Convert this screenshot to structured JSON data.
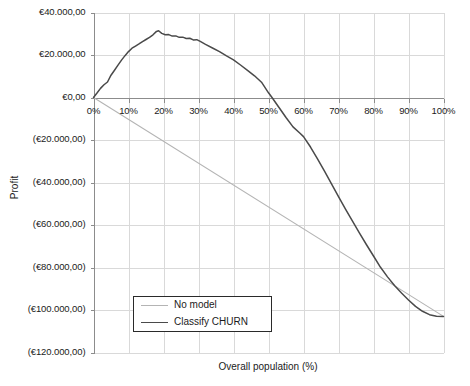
{
  "chart_data": {
    "type": "line",
    "title": "",
    "xlabel": "Overall population (%)",
    "ylabel": "Profit",
    "xlim": [
      0,
      100
    ],
    "ylim": [
      -120000,
      40000
    ],
    "grid": true,
    "legend_position": "bottom-left",
    "x_tick_labels": [
      "0%",
      "10%",
      "20%",
      "30%",
      "40%",
      "50%",
      "60%",
      "70%",
      "80%",
      "90%",
      "100%"
    ],
    "x_tick_values": [
      0,
      10,
      20,
      30,
      40,
      50,
      60,
      70,
      80,
      90,
      100
    ],
    "y_tick_labels": [
      "€40.000,00",
      "€20.000,00",
      "€0,00",
      "(€20.000,00)",
      "(€40.000,00)",
      "(€60.000,00)",
      "(€80.000,00)",
      "(€100.000,00)",
      "(€120.000,00)"
    ],
    "y_tick_values": [
      40000,
      20000,
      0,
      -20000,
      -40000,
      -60000,
      -80000,
      -100000,
      -120000
    ],
    "series": [
      {
        "name": "No model",
        "color": "#b4b4b4",
        "width": 1.1,
        "x": [
          0,
          100
        ],
        "values": [
          0,
          -103000
        ]
      },
      {
        "name": "Classify CHURN",
        "color": "#4a4a4a",
        "width": 1.5,
        "x": [
          0,
          1,
          2,
          3,
          4,
          5,
          6,
          7,
          8,
          9,
          10,
          11,
          12,
          13,
          14,
          15,
          16,
          17,
          18,
          18.6,
          19.5,
          20.5,
          21.5,
          22.5,
          23.5,
          24.5,
          25.5,
          26.5,
          27.5,
          28.5,
          29.5,
          30.5,
          32,
          34,
          36,
          38,
          40,
          42,
          44,
          46,
          48,
          50,
          51,
          53,
          55,
          57,
          59,
          60,
          62,
          64,
          66,
          68,
          70,
          72,
          74,
          76,
          78,
          80,
          82,
          84,
          86,
          88,
          90,
          92,
          94,
          96,
          98,
          100
        ],
        "values": [
          0,
          2100,
          4300,
          6000,
          7300,
          10500,
          12800,
          15200,
          17600,
          19700,
          21600,
          23200,
          24200,
          25200,
          26300,
          27300,
          28300,
          29500,
          31100,
          31400,
          30200,
          29500,
          29600,
          28900,
          29000,
          28300,
          28400,
          27800,
          27900,
          27100,
          27200,
          26400,
          25000,
          23300,
          21600,
          19600,
          17700,
          15300,
          12800,
          10200,
          7200,
          2200,
          0,
          -4700,
          -9400,
          -13800,
          -16800,
          -18400,
          -23300,
          -28900,
          -34600,
          -40600,
          -46600,
          -52500,
          -58200,
          -63800,
          -69300,
          -74600,
          -79900,
          -84400,
          -88500,
          -92000,
          -95300,
          -98300,
          -100600,
          -102200,
          -102900,
          -103000
        ]
      }
    ]
  },
  "legend": {
    "items": [
      {
        "label": "No model",
        "color": "#b4b4b4",
        "width": 1.1
      },
      {
        "label": "Classify CHURN",
        "color": "#4a4a4a",
        "width": 1.5
      }
    ]
  },
  "style": {
    "grid_color": "#d9d9d9",
    "axis_color": "#8c8c8c",
    "text_color": "#1b1b1b",
    "background": "#ffffff"
  }
}
